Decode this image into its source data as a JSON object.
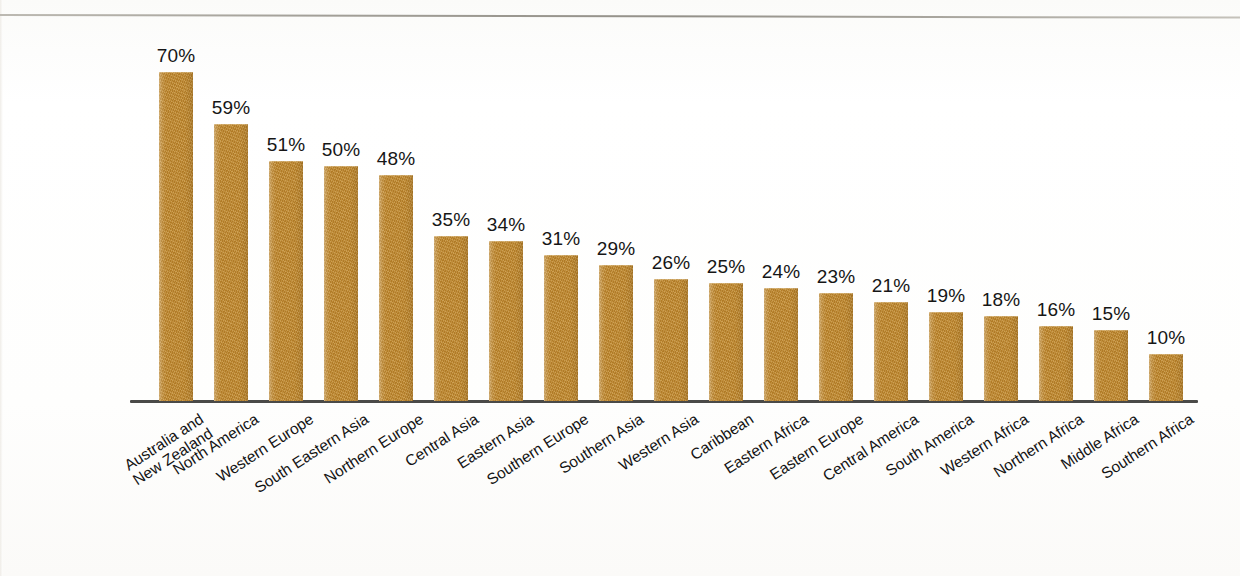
{
  "page": {
    "background_color": "#fdfdfc",
    "rule_color": "#9e9b93"
  },
  "chart_data": {
    "type": "bar",
    "title": "",
    "subtitle": "",
    "xlabel": "",
    "ylabel": "",
    "ylim": [
      0,
      70
    ],
    "grid": false,
    "legend": null,
    "value_suffix": "%",
    "bar_color": "#c0882c",
    "axis_color": "#4a4a48",
    "categories": [
      "Australia and\nNew Zealand",
      "North America",
      "Western Europe",
      "South Eastern Asia",
      "Northern Europe",
      "Central Asia",
      "Eastern Asia",
      "Southern Europe",
      "Southern Asia",
      "Western Asia",
      "Caribbean",
      "Eastern Africa",
      "Eastern Europe",
      "Central America",
      "South America",
      "Western Africa",
      "Northern Africa",
      "Middle Africa",
      "Southern Africa"
    ],
    "values": [
      70,
      59,
      51,
      50,
      48,
      35,
      34,
      31,
      29,
      26,
      25,
      24,
      23,
      21,
      19,
      18,
      16,
      15,
      10
    ],
    "data_labels": [
      "70%",
      "59%",
      "51%",
      "50%",
      "48%",
      "35%",
      "34%",
      "31%",
      "29%",
      "26%",
      "25%",
      "24%",
      "23%",
      "21%",
      "19%",
      "18%",
      "16%",
      "15%",
      "10%"
    ]
  }
}
